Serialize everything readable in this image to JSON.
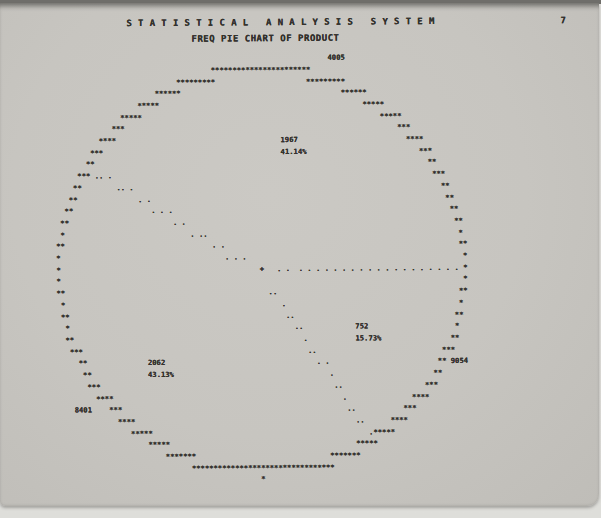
{
  "page": {
    "title": "S T A T I S T I C A L   A N A L Y S I S   S Y S T E M",
    "subtitle": "FREQ PIE CHART OF PRODUCT",
    "page_number": "7"
  },
  "colors": {
    "paper": "#c7c5c0",
    "scan_background": "#dededa",
    "scan_top_edge": "#6f6e6a",
    "ink": "#33312d"
  },
  "chart_data": {
    "type": "pie",
    "title": "FREQ PIE CHART OF PRODUCT",
    "stat": "FREQ",
    "variable": "PRODUCT",
    "categories": [
      "4005",
      "8401",
      "9054"
    ],
    "values": [
      1967,
      2062,
      752
    ],
    "percent_labels": [
      "41.14%",
      "43.13%",
      "15.73%"
    ],
    "total": 4781,
    "start_angle_deg": 0,
    "direction": "counterclockwise",
    "slices": [
      {
        "category": "4005",
        "freq": "1967",
        "pct": "41.14%",
        "start_deg": 0,
        "end_deg": 148.12,
        "category_pos": {
          "row": 3,
          "col": 76
        },
        "freq_pos": {
          "row": 10,
          "col": 65
        },
        "pct_pos": {
          "row": 11,
          "col": 65
        }
      },
      {
        "category": "8401",
        "freq": "2062",
        "pct": "43.13%",
        "start_deg": 148.12,
        "end_deg": 303.42,
        "category_pos": {
          "row": 33,
          "col": 17
        },
        "freq_pos": {
          "row": 29,
          "col": 34
        },
        "pct_pos": {
          "row": 30,
          "col": 34
        }
      },
      {
        "category": "9054",
        "freq": "752",
        "pct": "15.73%",
        "start_deg": 303.42,
        "end_deg": 360,
        "category_pos": {
          "row": 29,
          "col": 104
        },
        "freq_pos": {
          "row": 26,
          "col": 82
        },
        "pct_pos": {
          "row": 27,
          "col": 82
        }
      }
    ],
    "ascii": {
      "rows": 41,
      "cols": 120,
      "center_row": 21.25,
      "center_col": 59.8,
      "radius_rows": 17.25,
      "radius_cols": 46.8,
      "outline_char": "*",
      "dot_char": ".",
      "center_char": "+",
      "center_print": {
        "row": 21,
        "col": 60
      },
      "radius_line_angles_deg": [
        0,
        148.12,
        303.42
      ],
      "dot_start_frac": 0.1,
      "dot_end_frac": 0.96,
      "dot_count": 21
    }
  }
}
